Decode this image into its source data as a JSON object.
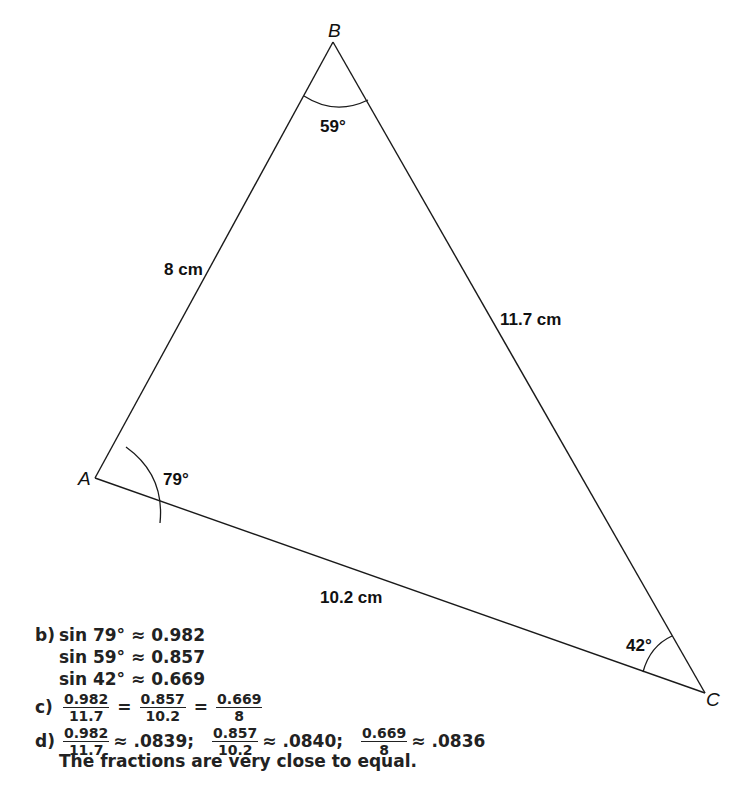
{
  "figure": {
    "vertices": {
      "A": {
        "label": "A",
        "x": 95,
        "y": 478
      },
      "B": {
        "label": "B",
        "x": 333,
        "y": 42
      },
      "C": {
        "label": "C",
        "x": 705,
        "y": 693
      }
    },
    "sides": {
      "AB": "8 cm",
      "BC": "11.7 cm",
      "AC": "10.2 cm"
    },
    "angles": {
      "A": "79°",
      "B": "59°",
      "C": "42°"
    },
    "stroke_color": "#1a1a1a"
  },
  "solution": {
    "b": {
      "tag": "b)",
      "lines": [
        "sin 79° ≈ 0.982",
        "sin 59° ≈ 0.857",
        "sin 42° ≈ 0.669"
      ]
    },
    "c": {
      "tag": "c)",
      "fractions": [
        {
          "num": "0.982",
          "den": "11.7"
        },
        {
          "num": "0.857",
          "den": "10.2"
        },
        {
          "num": "0.669",
          "den": "8"
        }
      ],
      "operator": "="
    },
    "d": {
      "tag": "d)",
      "items": [
        {
          "num": "0.982",
          "den": "11.7",
          "approx": "≈ .0839;"
        },
        {
          "num": "0.857",
          "den": "10.2",
          "approx": "≈ .0840;"
        },
        {
          "num": "0.669",
          "den": "8",
          "approx": "≈ .0836"
        }
      ],
      "conclusion": "The fractions are very close to equal."
    }
  }
}
